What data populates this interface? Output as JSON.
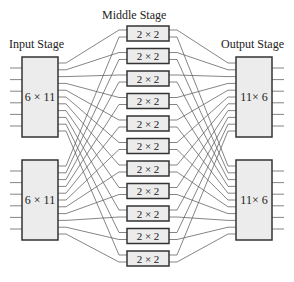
{
  "titles": {
    "input": "Input Stage",
    "middle": "Middle Stage",
    "output": "Output Stage"
  },
  "input_switches": [
    {
      "label": "6 × 11"
    },
    {
      "label": "6 × 11"
    }
  ],
  "middle_switches": [
    {
      "label": "2 × 2"
    },
    {
      "label": "2 × 2"
    },
    {
      "label": "2 × 2"
    },
    {
      "label": "2 × 2"
    },
    {
      "label": "2 × 2"
    },
    {
      "label": "2 × 2"
    },
    {
      "label": "2 × 2"
    },
    {
      "label": "2 × 2"
    },
    {
      "label": "2 × 2"
    },
    {
      "label": "2 × 2"
    },
    {
      "label": "2 × 2"
    }
  ],
  "output_switches": [
    {
      "label": "11× 6"
    },
    {
      "label": "11× 6"
    }
  ],
  "colors": {
    "box_fill": "#ececec",
    "box_stroke": "#333333",
    "wire": "#666666"
  }
}
